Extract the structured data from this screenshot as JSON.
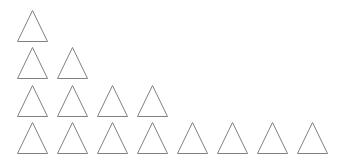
{
  "figure": {
    "name": "triangle-doubling-pattern",
    "background_color": "#ffffff",
    "width": 338,
    "height": 162,
    "shape": "triangle",
    "shape_style": "outline",
    "stroke_color": "#808080",
    "fill_color": "none",
    "stroke_width": 1,
    "alignment": "left",
    "triangle_width": 31,
    "triangle_height": 32,
    "horizontal_pitch": 40,
    "horizontal_gap": 9,
    "row_pitch": 37.5,
    "first_row_left": 17,
    "first_row_top": 10,
    "total_count": 15,
    "rows": [
      {
        "index": 1,
        "count": 1,
        "top": 10,
        "label": "row-1"
      },
      {
        "index": 2,
        "count": 2,
        "top": 47,
        "label": "row-2"
      },
      {
        "index": 3,
        "count": 4,
        "top": 85,
        "label": "row-3"
      },
      {
        "index": 4,
        "count": 8,
        "top": 122,
        "label": "row-4"
      }
    ]
  },
  "chart_data": {
    "type": "bar",
    "title": "",
    "subtitle": "",
    "xlabel": "",
    "ylabel": "",
    "categories": [
      "Row 1",
      "Row 2",
      "Row 3",
      "Row 4"
    ],
    "values": [
      1,
      2,
      4,
      8
    ],
    "ylim": [
      0,
      8
    ],
    "grid": false,
    "legend": "none",
    "annotations": [],
    "unit_glyph": "triangle"
  }
}
